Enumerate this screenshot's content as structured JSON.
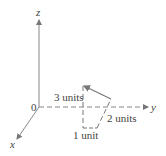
{
  "diagram": {
    "axes": {
      "z_label": "z",
      "y_label": "y",
      "x_label": "x",
      "origin_label": "0"
    },
    "labels": {
      "height": "3 units",
      "depth": "2 units",
      "width": "1 unit"
    },
    "colors": {
      "line": "#777777",
      "text": "#444444"
    }
  }
}
